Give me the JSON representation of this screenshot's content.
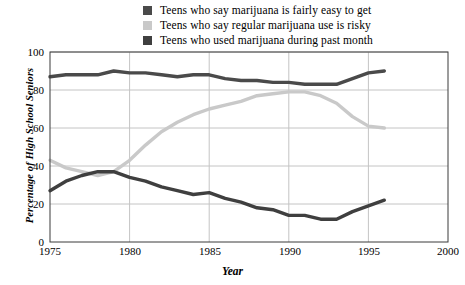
{
  "chart_data": {
    "type": "line",
    "title": "",
    "xlabel": "Year",
    "ylabel": "Percentage of High School Seniors",
    "xlim": [
      1975,
      2000
    ],
    "ylim": [
      0,
      100
    ],
    "xticks": [
      1975,
      1980,
      1985,
      1990,
      1995,
      2000
    ],
    "yticks": [
      0,
      20,
      40,
      60,
      80,
      100
    ],
    "grid": true,
    "legend_position": "top-center",
    "x": [
      1975,
      1976,
      1977,
      1978,
      1979,
      1980,
      1981,
      1982,
      1983,
      1984,
      1985,
      1986,
      1987,
      1988,
      1989,
      1990,
      1991,
      1992,
      1993,
      1994,
      1995,
      1996
    ],
    "series": [
      {
        "name": "Teens who say marijuana is fairly easy to get",
        "color": "#4a4a4a",
        "values": [
          87,
          88,
          88,
          88,
          90,
          89,
          89,
          88,
          87,
          88,
          88,
          86,
          85,
          85,
          84,
          84,
          83,
          83,
          83,
          86,
          89,
          90
        ]
      },
      {
        "name": "Teens who say regular marijuana use is risky",
        "color": "#c9c9c9",
        "values": [
          43,
          39,
          37,
          35,
          37,
          43,
          51,
          58,
          63,
          67,
          70,
          72,
          74,
          77,
          78,
          79,
          79,
          77,
          73,
          66,
          61,
          60
        ]
      },
      {
        "name": "Teens who used marijuana during past month",
        "color": "#3f3f3f",
        "values": [
          27,
          32,
          35,
          37,
          37,
          34,
          32,
          29,
          27,
          25,
          26,
          23,
          21,
          18,
          17,
          14,
          14,
          12,
          12,
          16,
          19,
          22
        ]
      }
    ]
  },
  "legend": {
    "items": [
      {
        "label": "Teens who say marijuana is fairly easy to get",
        "swatch": "#4a4a4a"
      },
      {
        "label": "Teens who say regular marijuana use is risky",
        "swatch": "#c9c9c9"
      },
      {
        "label": "Teens who used marijuana during past month",
        "swatch": "#3f3f3f"
      }
    ]
  },
  "axes": {
    "y_title": "Percentage of High School Seniors",
    "x_title": "Year",
    "y_tick_labels": [
      "100",
      "80",
      "60",
      "40",
      "20",
      "0"
    ],
    "x_tick_labels": [
      "1975",
      "1980",
      "1985",
      "1990",
      "1995",
      "2000"
    ]
  },
  "colors": {
    "axis": "#3a3a3a",
    "grid": "#c4c4c4",
    "background": "#ffffff"
  }
}
